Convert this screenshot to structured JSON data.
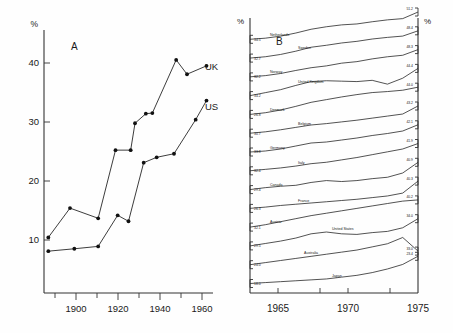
{
  "figure": {
    "background": "#fefefe",
    "ink": "#1a1a1a"
  },
  "panel_a": {
    "label": "A",
    "y_axis_unit": "%",
    "series_labels": {
      "uk": "UK",
      "us": "US"
    }
  },
  "panel_b": {
    "label": "B",
    "y_axis_unit_left": "%",
    "y_axis_unit_right": "%"
  },
  "chart_data": [
    {
      "type": "line",
      "panel": "A",
      "title": "A",
      "xlabel": "",
      "ylabel": "%",
      "xlim": [
        1888,
        1966
      ],
      "ylim": [
        0,
        44
      ],
      "xticks": [
        1900,
        1920,
        1940,
        1960
      ],
      "xticks_minor": [
        1890,
        1910,
        1930,
        1950
      ],
      "yticks": [
        10,
        20,
        30,
        40
      ],
      "grid": false,
      "legend": "inline-right",
      "series": [
        {
          "name": "UK",
          "x": [
            1890,
            1900,
            1913,
            1921,
            1928,
            1930,
            1935,
            1938,
            1949,
            1954,
            1963
          ],
          "values": [
            9.3,
            14.2,
            12.5,
            23.9,
            23.9,
            28.4,
            30.0,
            30.1,
            39.0,
            36.6,
            38.0
          ]
        },
        {
          "name": "US",
          "x": [
            1890,
            1902,
            1913,
            1922,
            1927,
            1934,
            1940,
            1948,
            1958,
            1963
          ],
          "values": [
            7.0,
            7.4,
            7.8,
            13.0,
            12.0,
            21.8,
            22.7,
            23.3,
            29.0,
            32.2
          ]
        }
      ]
    },
    {
      "type": "line",
      "panel": "B",
      "title": "B",
      "xlabel": "",
      "ylabel": "%",
      "xlim": [
        1963,
        1975
      ],
      "ylim": [
        16,
        53
      ],
      "xticks": [
        1965,
        1970,
        1975
      ],
      "grid": false,
      "note": "Stacked/offset country series; each labelled with start value (left) and end value (right).",
      "series": [
        {
          "name": "Netherlands",
          "start_value": null,
          "end_value": "51.2",
          "y": [
            33.8,
            34.5,
            35.8,
            37.8,
            40.2,
            41.8,
            43.0,
            43.6,
            45.0,
            46.2,
            47.0,
            51.2
          ]
        },
        {
          "name": "Sweden",
          "start_value": "34.5",
          "end_value": "48.4",
          "y": [
            31.8,
            32.6,
            34.0,
            36.0,
            38.4,
            39.6,
            41.0,
            42.0,
            43.4,
            44.4,
            45.2,
            48.4
          ]
        },
        {
          "name": "Norway",
          "start_value": "32.7",
          "end_value": "48.3",
          "y": [
            30.4,
            31.2,
            32.6,
            34.6,
            36.4,
            37.6,
            39.4,
            40.4,
            42.2,
            43.6,
            44.6,
            48.3
          ]
        },
        {
          "name": "United Kingdom",
          "start_value": "32.2",
          "end_value": "44.4",
          "y": [
            31.6,
            33.0,
            34.4,
            36.4,
            38.2,
            38.6,
            38.4,
            38.2,
            38.8,
            37.0,
            39.8,
            44.4
          ]
        },
        {
          "name": "Denmark",
          "start_value": "34.2",
          "end_value": "44.0",
          "y": [
            27.0,
            28.0,
            29.6,
            31.8,
            34.2,
            35.8,
            37.4,
            38.8,
            40.0,
            40.6,
            41.4,
            43.2
          ]
        },
        {
          "name": "Belgium",
          "start_value": "26.8",
          "end_value": "43.2",
          "y": [
            26.2,
            27.0,
            28.2,
            29.6,
            31.0,
            31.8,
            32.8,
            33.8,
            35.0,
            36.2,
            37.4,
            42.1
          ]
        },
        {
          "name": "Germany",
          "start_value": "30.7",
          "end_value": "42.1",
          "y": [
            31.0,
            31.4,
            32.2,
            33.4,
            34.6,
            35.0,
            35.8,
            36.6,
            37.6,
            38.4,
            39.4,
            41.9
          ]
        },
        {
          "name": "Italy",
          "start_value": "33.8",
          "end_value": "41.9",
          "y": [
            29.4,
            30.0,
            30.6,
            31.4,
            32.4,
            33.0,
            34.0,
            35.0,
            36.2,
            37.4,
            38.6,
            40.9
          ]
        },
        {
          "name": "Canada",
          "start_value": "32.4",
          "end_value": "40.9",
          "y": [
            28.8,
            29.6,
            30.2,
            30.6,
            31.8,
            32.6,
            32.2,
            32.6,
            33.4,
            34.0,
            35.8,
            40.3
          ]
        },
        {
          "name": "France",
          "start_value": "29.4",
          "end_value": "40.3",
          "y": [
            27.0,
            27.6,
            28.4,
            29.0,
            29.6,
            30.2,
            30.8,
            31.4,
            32.2,
            33.0,
            34.4,
            40.2
          ]
        },
        {
          "name": "Austria",
          "start_value": "26.3",
          "end_value": "40.2",
          "y": [
            25.0,
            25.8,
            26.8,
            27.8,
            28.8,
            29.6,
            30.4,
            31.2,
            32.0,
            32.8,
            33.6,
            34.0
          ]
        },
        {
          "name": "United States",
          "start_value": "32.1",
          "end_value": "34.0",
          "y": [
            24.0,
            24.8,
            25.6,
            26.6,
            28.0,
            28.6,
            28.0,
            27.8,
            28.4,
            28.8,
            30.0,
            33.0
          ]
        },
        {
          "name": "Australia",
          "start_value": "29.5",
          "end_value": "33.0",
          "y": [
            20.8,
            21.2,
            21.6,
            22.0,
            22.4,
            22.8,
            23.2,
            23.6,
            24.2,
            24.8,
            26.0,
            23.4
          ]
        },
        {
          "name": "Japan",
          "start_value": "24.0",
          "end_value": "23.4",
          "y": [
            17.4,
            17.6,
            17.8,
            18.0,
            18.2,
            18.4,
            18.8,
            19.2,
            19.8,
            20.6,
            21.6,
            23.4
          ]
        }
      ],
      "left_value_labels": [
        "34.5",
        "32.7",
        "32.2",
        "34.2",
        "26.8",
        "30.7",
        "33.8",
        "32.4",
        "29.4",
        "26.3",
        "32.1",
        "29.5",
        "24.0",
        "18.0"
      ],
      "right_value_labels": [
        "51.2",
        "48.4",
        "48.3",
        "44.4",
        "44.0",
        "43.2",
        "42.1",
        "41.9",
        "40.9",
        "40.3",
        "40.2",
        "34.0",
        "33.0",
        "23.4"
      ],
      "country_labels": [
        "Netherlands",
        "Sweden",
        "Norway",
        "United Kingdom",
        "Denmark",
        "Belgium",
        "Germany",
        "Italy",
        "Canada",
        "France",
        "Austria",
        "United States",
        "Australia",
        "Japan"
      ],
      "xtick_labels": [
        "1965",
        "1970",
        "1975"
      ]
    }
  ]
}
